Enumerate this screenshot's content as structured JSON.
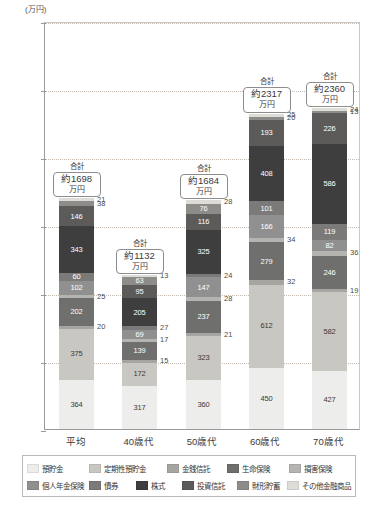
{
  "chart_data": {
    "type": "bar",
    "subtype": "stacked-bar",
    "title": "",
    "unit_label": "(万円)",
    "xlabel": "",
    "ylabel": "",
    "ylim": [
      0,
      3000
    ],
    "yticks": [
      0,
      500,
      1000,
      1500,
      2000,
      2500,
      3000
    ],
    "grid": true,
    "legend_position": "bottom",
    "categories": [
      "平均",
      "40歳代",
      "50歳代",
      "60歳代",
      "70歳代"
    ],
    "totals_caption": "合計",
    "totals": [
      "約1698万円",
      "約1132万円",
      "約1684万円",
      "約2317万円",
      "約2360万円"
    ],
    "totals_value": [
      1698,
      1132,
      1684,
      2317,
      2360
    ],
    "totals_unit": "万円",
    "series": [
      {
        "name": "預貯金",
        "color": "#ededeb",
        "values": [
          364,
          317,
          360,
          450,
          427
        ]
      },
      {
        "name": "定期性預貯金",
        "color": "#c8c7c2",
        "values": [
          375,
          172,
          323,
          612,
          582
        ]
      },
      {
        "name": "金銭信託",
        "color": "#a6a5a1",
        "values": [
          20,
          15,
          21,
          32,
          19
        ]
      },
      {
        "name": "生命保険",
        "color": "#6f6f6d",
        "values": [
          202,
          139,
          237,
          279,
          246
        ]
      },
      {
        "name": "損害保険",
        "color": "#b5b4b0",
        "values": [
          25,
          17,
          28,
          34,
          36
        ]
      },
      {
        "name": "個人年金保険",
        "color": "#919090",
        "values": [
          102,
          69,
          147,
          166,
          82
        ]
      },
      {
        "name": "債券",
        "color": "#7b7a78",
        "values": [
          60,
          27,
          24,
          101,
          119
        ]
      },
      {
        "name": "株式",
        "color": "#3e3e3e",
        "values": [
          343,
          205,
          325,
          408,
          586
        ]
      },
      {
        "name": "投資信託",
        "color": "#5c5b5a",
        "values": [
          146,
          95,
          116,
          193,
          226
        ]
      },
      {
        "name": "財形貯蓄",
        "color": "#8d8c89",
        "values": [
          38,
          63,
          76,
          20,
          13
        ]
      },
      {
        "name": "その他金融商品",
        "color": "#dedcd7",
        "values": [
          21,
          13,
          28,
          25,
          24
        ]
      }
    ],
    "label_placement": {
      "平均": {
        "inside": [
          "預貯金",
          "定期性預貯金",
          "生命保険",
          "個人年金保険",
          "債券",
          "株式",
          "投資信託"
        ],
        "outside": [
          "金銭信託",
          "損害保険",
          "財形貯蓄",
          "その他金融商品"
        ]
      },
      "40歳代": {
        "inside": [
          "預貯金",
          "定期性預貯金",
          "生命保険",
          "個人年金保険",
          "株式",
          "投資信託",
          "財形貯蓄"
        ],
        "outside": [
          "金銭信託",
          "損害保険",
          "債券",
          "その他金融商品"
        ]
      },
      "50歳代": {
        "inside": [
          "預貯金",
          "定期性預貯金",
          "生命保険",
          "個人年金保険",
          "株式",
          "投資信託",
          "財形貯蓄"
        ],
        "outside": [
          "金銭信託",
          "損害保険",
          "債券",
          "その他金融商品"
        ]
      },
      "60歳代": {
        "inside": [
          "預貯金",
          "定期性預貯金",
          "生命保険",
          "個人年金保険",
          "債券",
          "株式",
          "投資信託"
        ],
        "outside": [
          "金銭信託",
          "損害保険",
          "財形貯蓄",
          "その他金融商品"
        ]
      },
      "70歳代": {
        "inside": [
          "預貯金",
          "定期性預貯金",
          "生命保険",
          "個人年金保険",
          "債券",
          "株式",
          "投資信託"
        ],
        "outside": [
          "金銭信託",
          "損害保険",
          "財形貯蓄",
          "その他金融商品"
        ]
      }
    }
  }
}
